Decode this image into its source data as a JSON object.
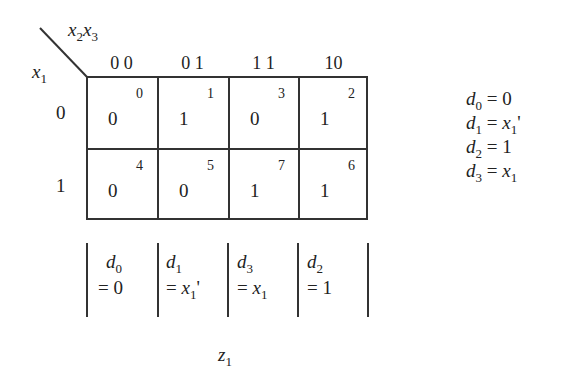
{
  "kmap": {
    "row_var": "x",
    "row_var_sub": "1",
    "col_var_a": "x",
    "col_var_a_sub": "2",
    "col_var_b": "x",
    "col_var_b_sub": "3",
    "col_headers": [
      "0 0",
      "0 1",
      "1 1",
      "10"
    ],
    "row_headers": [
      "0",
      "1"
    ],
    "cells": [
      [
        {
          "value": "0",
          "index": "0"
        },
        {
          "value": "1",
          "index": "1"
        },
        {
          "value": "0",
          "index": "3"
        },
        {
          "value": "1",
          "index": "2"
        }
      ],
      [
        {
          "value": "0",
          "index": "4"
        },
        {
          "value": "0",
          "index": "5"
        },
        {
          "value": "1",
          "index": "7"
        },
        {
          "value": "1",
          "index": "6"
        }
      ]
    ]
  },
  "mux_inputs": [
    {
      "name": "d",
      "sub": "0",
      "expr_prefix": "= ",
      "expr": "0",
      "expr_italic": false,
      "expr_sub": "",
      "expr_suffix": ""
    },
    {
      "name": "d",
      "sub": "1",
      "expr_prefix": "= ",
      "expr": "x",
      "expr_italic": true,
      "expr_sub": "1",
      "expr_suffix": "'"
    },
    {
      "name": "d",
      "sub": "3",
      "expr_prefix": "= ",
      "expr": "x",
      "expr_italic": true,
      "expr_sub": "1",
      "expr_suffix": ""
    },
    {
      "name": "d",
      "sub": "2",
      "expr_prefix": "= ",
      "expr": "1",
      "expr_italic": false,
      "expr_sub": "",
      "expr_suffix": ""
    }
  ],
  "output_label": {
    "name": "z",
    "sub": "1"
  },
  "equations": [
    {
      "lhs": "d",
      "lhs_sub": "0",
      "eq": " = ",
      "rhs": "0",
      "rhs_italic": false,
      "rhs_sub": "",
      "rhs_suffix": ""
    },
    {
      "lhs": "d",
      "lhs_sub": "1",
      "eq": " = ",
      "rhs": "x",
      "rhs_italic": true,
      "rhs_sub": "1",
      "rhs_suffix": "'"
    },
    {
      "lhs": "d",
      "lhs_sub": "2",
      "eq": " = ",
      "rhs": "1",
      "rhs_italic": false,
      "rhs_sub": "",
      "rhs_suffix": ""
    },
    {
      "lhs": "d",
      "lhs_sub": "3",
      "eq": " = ",
      "rhs": "x",
      "rhs_italic": true,
      "rhs_sub": "1",
      "rhs_suffix": ""
    }
  ]
}
